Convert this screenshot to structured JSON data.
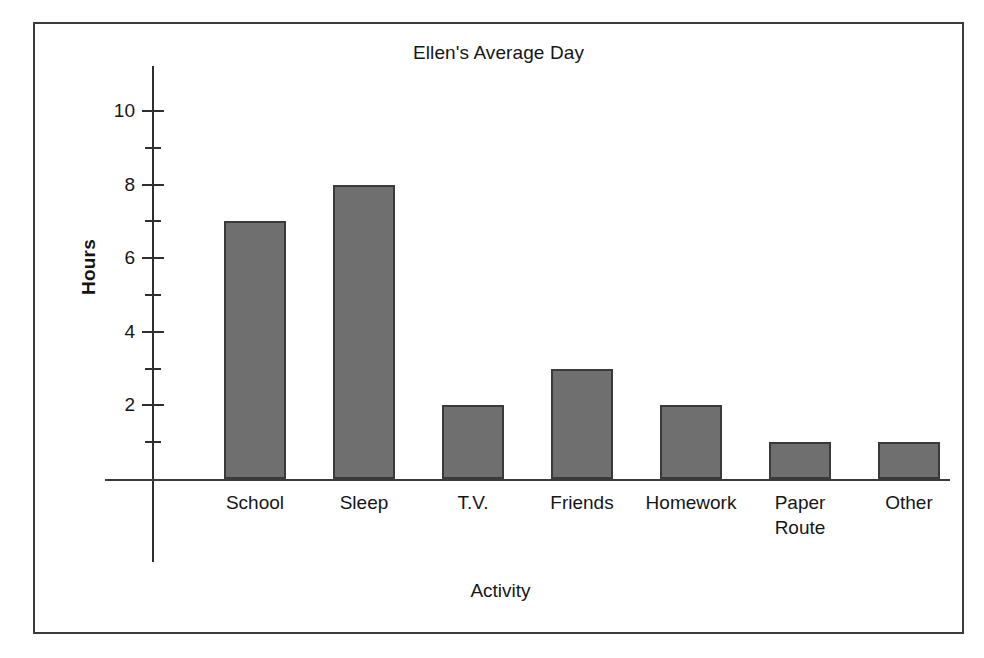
{
  "chart_data": {
    "type": "bar",
    "title": "Ellen's Average Day",
    "xlabel": "Activity",
    "ylabel": "Hours",
    "categories": [
      "School",
      "Sleep",
      "T.V.",
      "Friends",
      "Homework",
      "Paper\nRoute",
      "Other"
    ],
    "values": [
      7,
      8,
      2,
      3,
      2,
      1,
      1
    ],
    "ylim": [
      0,
      10.8
    ],
    "y_major_ticks": [
      2,
      4,
      6,
      8,
      10
    ],
    "y_major_tick_labels": [
      "2",
      "4",
      "6",
      "8",
      "10"
    ],
    "y_minor_ticks": [
      1,
      3,
      5,
      7,
      9
    ],
    "grid": false,
    "legend": false,
    "bar_color": "#6f6f6f",
    "bar_border_color": "#3a3a3a",
    "axis_color": "#2f2f2f",
    "frame_color": "#3b3b3b",
    "background": "#ffffff"
  }
}
